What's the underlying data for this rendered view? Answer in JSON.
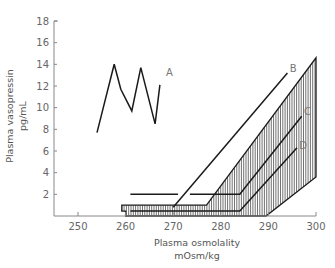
{
  "chart_data": {
    "type": "line",
    "title": "",
    "xlabel": "Plasma osmolality",
    "xlabel_unit": "mOsm/kg",
    "ylabel": "Plasma vasopressin",
    "ylabel_unit": "pg/mL",
    "xlim": [
      245,
      300
    ],
    "ylim": [
      0,
      18
    ],
    "x_ticks": [
      250,
      260,
      270,
      280,
      290,
      300
    ],
    "y_ticks": [
      2,
      4,
      6,
      8,
      10,
      12,
      14,
      16,
      18
    ],
    "grid": false,
    "series": [
      {
        "name": "A",
        "points": [
          [
            254.0,
            7.7
          ],
          [
            257.6,
            14.0
          ],
          [
            259.0,
            11.7
          ],
          [
            261.3,
            9.7
          ],
          [
            263.2,
            13.7
          ],
          [
            266.2,
            8.5
          ],
          [
            267.2,
            12.1
          ]
        ],
        "label_at": [
          268.5,
          13.3
        ]
      },
      {
        "name": "B",
        "points": [
          [
            270.0,
            0.8
          ],
          [
            294.0,
            13.2
          ]
        ],
        "label_at": [
          294.5,
          13.7
        ]
      },
      {
        "name": "C",
        "points": [
          [
            261.0,
            2.0
          ],
          [
            271.0,
            2.0
          ],
          null,
          [
            273.5,
            2.0
          ],
          [
            284.0,
            2.0
          ],
          [
            297.0,
            9.2
          ]
        ],
        "label_at": [
          297.5,
          9.7
        ]
      },
      {
        "name": "D",
        "points": [
          [
            261.0,
            0.45
          ],
          [
            284.0,
            0.45
          ],
          [
            296.0,
            6.3
          ]
        ],
        "label_at": [
          296.5,
          6.6
        ]
      }
    ],
    "shaded_region": {
      "name": "normal range",
      "pattern": "vertical hatching",
      "polygon": [
        [
          259.2,
          1.0
        ],
        [
          277.0,
          1.0
        ],
        [
          300.0,
          14.6
        ],
        [
          300.0,
          3.6
        ],
        [
          289.5,
          0.0
        ],
        [
          260.0,
          0.0
        ],
        [
          260.0,
          0.45
        ],
        [
          259.2,
          0.45
        ]
      ]
    }
  }
}
